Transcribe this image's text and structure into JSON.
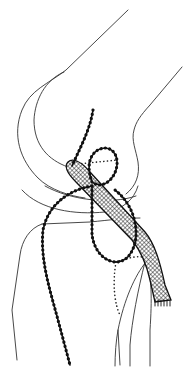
{
  "figure": {
    "description": "Lateral line drawing of a knee joint showing a cross-hatched ligament graft with beaded suture loops",
    "colors": {
      "background": "#ffffff",
      "line": "#333333",
      "suture": "#111111"
    },
    "elements": [
      {
        "id": "femur",
        "label": "femur outline"
      },
      {
        "id": "femoral-condyle",
        "label": "femoral condyle"
      },
      {
        "id": "tibia",
        "label": "tibia outline"
      },
      {
        "id": "fibula",
        "label": "fibula outline"
      },
      {
        "id": "graft",
        "label": "cross-hatched graft band"
      },
      {
        "id": "suture-loop",
        "label": "beaded suture loop"
      },
      {
        "id": "dotted-path",
        "label": "dotted tunnel path"
      }
    ]
  }
}
